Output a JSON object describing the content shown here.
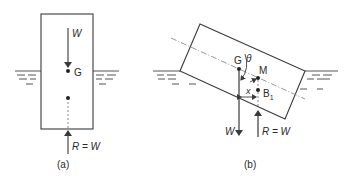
{
  "figure_a": {
    "caption": "(a)",
    "weight_label": "W",
    "center_of_gravity_label": "G",
    "reaction_label": "R = W"
  },
  "figure_b": {
    "caption": "(b)",
    "weight_label": "W",
    "center_of_gravity_label": "G",
    "metacentre_label": "M",
    "buoyancy_centre_label": "B",
    "buoyancy_centre_subscript": "1",
    "angle_label": "θ",
    "distance_label": "x",
    "reaction_label": "R = W"
  },
  "colors": {
    "line": "#3a3a3a",
    "dash": "#8a8a8a",
    "water": "#555555"
  }
}
